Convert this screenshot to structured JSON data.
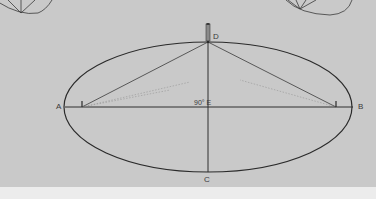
{
  "diagram": {
    "background_color": "#c9c9c9",
    "line_color": "#2e2e2e",
    "labels": {
      "A": "A",
      "B": "B",
      "C": "C",
      "D": "D",
      "E": "90° E"
    },
    "points": {
      "A": [
        65,
        107
      ],
      "B": [
        353,
        107
      ],
      "C": [
        208,
        172
      ],
      "D": [
        208,
        42
      ],
      "E": [
        208,
        107
      ],
      "focus_left": [
        82,
        107
      ],
      "focus_right": [
        336,
        107
      ]
    },
    "ellipse": {
      "cx": 208,
      "cy": 107,
      "rx": 144,
      "ry": 65
    },
    "angle_label": "90°"
  }
}
